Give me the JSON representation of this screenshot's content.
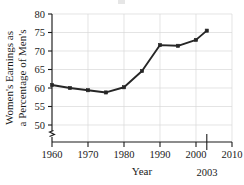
{
  "chart_data": {
    "type": "line",
    "title": "",
    "xlabel": "Year",
    "ylabel": "Women's Earnings as a Percentage of Men's",
    "ylabel_line1": "Women's Earnings as",
    "ylabel_line2": "a Percentage of Men's",
    "x": [
      1960,
      1965,
      1970,
      1975,
      1980,
      1985,
      1990,
      1995,
      2000,
      2003
    ],
    "values": [
      60.8,
      60.0,
      59.4,
      58.8,
      60.2,
      64.6,
      71.6,
      71.4,
      73.0,
      75.5
    ],
    "xlim": [
      1960,
      2010
    ],
    "ylim": [
      50,
      80
    ],
    "xticks": [
      1960,
      1970,
      1980,
      1990,
      2000,
      2010
    ],
    "xtick_labels": [
      "1960",
      "1970",
      "1980",
      "1990",
      "2000",
      "2010"
    ],
    "yticks": [
      50,
      55,
      60,
      65,
      70,
      75,
      80
    ],
    "ytick_labels": [
      "50",
      "55",
      "60",
      "65",
      "70",
      "75",
      "80"
    ],
    "annotation_tick": {
      "value": 2003,
      "label": "2003"
    },
    "grid": true,
    "grid_color": "#d8d8d8",
    "legend": false,
    "y_axis_break": true,
    "line_color": "#262626",
    "marker_color": "#262626",
    "marker": "square"
  }
}
